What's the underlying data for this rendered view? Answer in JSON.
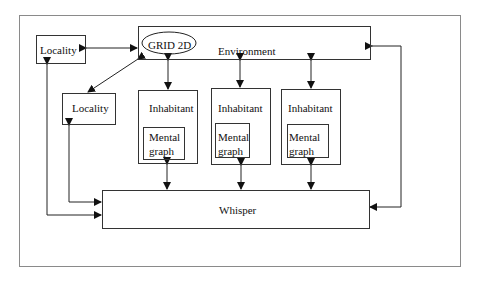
{
  "diagram": {
    "environment": {
      "label": "Environment",
      "grid_label": "GRID 2D"
    },
    "localities": [
      {
        "label": "Locality"
      },
      {
        "label": "Locality"
      }
    ],
    "inhabitants": [
      {
        "label": "Inhabitant",
        "mental_graph": [
          "Mental",
          "graph"
        ]
      },
      {
        "label": "Inhabitant",
        "mental_graph": [
          "Mental",
          "graph"
        ]
      },
      {
        "label": "Inhabitant",
        "mental_graph": [
          "Mental",
          "graph"
        ]
      }
    ],
    "whisper": {
      "label": "Whisper"
    },
    "colors": {
      "stroke": "#333333",
      "frame": "#8a8a8a",
      "background": "#ffffff"
    }
  }
}
